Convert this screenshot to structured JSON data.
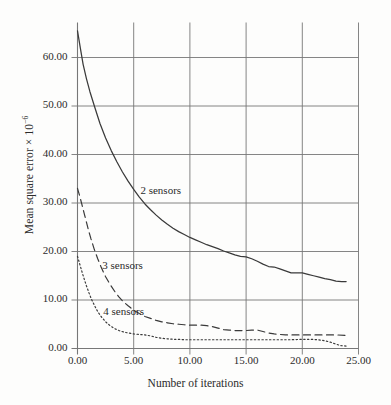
{
  "chart_data": {
    "type": "line",
    "title": "",
    "xlabel": "Number of iterations",
    "ylabel": "Mean square error × 10",
    "ylabel_exponent": "−6",
    "xlim": [
      0,
      25
    ],
    "ylim": [
      0,
      60
    ],
    "xticks": [
      "0.00",
      "5.00",
      "10.00",
      "15.00",
      "20.00",
      "25.00"
    ],
    "yticks": [
      "0.00",
      "10.00",
      "20.00",
      "30.00",
      "40.00",
      "50.00",
      "60.00"
    ],
    "xtick_values": [
      0,
      5,
      10,
      15,
      20,
      25
    ],
    "ytick_values": [
      0,
      10,
      20,
      30,
      40,
      50,
      60
    ],
    "grid": true,
    "legend_position": "inline-annotations",
    "series": [
      {
        "name": "2 sensors",
        "style": "solid",
        "color": "#3a3a3a",
        "annotation": "2 sensors",
        "annotation_xy": [
          5.6,
          31.8
        ],
        "x": [
          0.0,
          0.25,
          0.5,
          0.8,
          1.1,
          1.5,
          2.0,
          2.5,
          3.0,
          3.5,
          4.0,
          4.5,
          5.0,
          5.5,
          6.0,
          6.5,
          7.0,
          7.5,
          8.0,
          8.5,
          9.0,
          9.5,
          10.0,
          10.5,
          11.0,
          11.5,
          12.0,
          12.5,
          13.0,
          13.5,
          14.0,
          14.5,
          15.0,
          15.5,
          16.0,
          16.5,
          17.0,
          17.5,
          18.0,
          18.5,
          19.0,
          19.5,
          20.0,
          20.5,
          21.0,
          21.5,
          22.0,
          22.5,
          23.0,
          23.5,
          23.9
        ],
        "y": [
          65.5,
          62.0,
          58.6,
          55.6,
          53.0,
          50.0,
          46.4,
          43.4,
          40.8,
          38.5,
          36.4,
          34.5,
          32.8,
          31.2,
          29.8,
          28.6,
          27.5,
          26.5,
          25.6,
          24.8,
          24.1,
          23.5,
          22.9,
          22.4,
          21.9,
          21.4,
          21.0,
          20.6,
          20.1,
          19.7,
          19.3,
          19.0,
          18.9,
          18.5,
          18.0,
          17.4,
          16.9,
          16.8,
          16.4,
          16.0,
          15.6,
          15.6,
          15.6,
          15.3,
          15.0,
          14.7,
          14.4,
          14.2,
          13.9,
          13.8,
          13.8
        ]
      },
      {
        "name": "3 sensors",
        "style": "dashed",
        "color": "#3a3a3a",
        "annotation": "3 sensors",
        "annotation_xy": [
          2.2,
          16.3
        ],
        "x": [
          0.0,
          0.2,
          0.4,
          0.6,
          0.8,
          1.0,
          1.2,
          1.5,
          1.8,
          2.1,
          2.5,
          2.9,
          3.3,
          3.7,
          4.1,
          4.5,
          5.0,
          5.5,
          6.0,
          6.5,
          7.0,
          7.5,
          8.0,
          8.5,
          9.0,
          9.5,
          10.0,
          10.5,
          11.0,
          11.5,
          12.0,
          12.5,
          13.0,
          13.5,
          14.0,
          14.5,
          15.0,
          15.5,
          16.0,
          16.5,
          17.0,
          17.5,
          18.0,
          18.5,
          19.0,
          20.0,
          21.0,
          22.0,
          23.0,
          23.9
        ],
        "y": [
          33.0,
          31.4,
          29.6,
          27.8,
          26.0,
          24.2,
          22.6,
          20.4,
          18.5,
          16.8,
          14.8,
          13.2,
          11.8,
          10.6,
          9.6,
          8.8,
          7.9,
          7.2,
          6.6,
          6.2,
          5.8,
          5.5,
          5.3,
          5.1,
          5.0,
          4.9,
          4.8,
          4.8,
          4.8,
          4.7,
          4.5,
          4.2,
          3.9,
          3.8,
          3.7,
          3.7,
          3.7,
          3.8,
          3.8,
          3.5,
          3.2,
          3.0,
          2.9,
          2.8,
          2.8,
          2.8,
          2.8,
          2.8,
          2.8,
          2.7
        ]
      },
      {
        "name": "4 sensors",
        "style": "dotted",
        "color": "#3a3a3a",
        "annotation": "4 sensors",
        "annotation_xy": [
          2.3,
          7.0
        ],
        "x": [
          0.0,
          0.2,
          0.4,
          0.6,
          0.8,
          1.0,
          1.2,
          1.5,
          1.8,
          2.1,
          2.5,
          2.9,
          3.3,
          3.7,
          4.1,
          4.5,
          5.0,
          5.5,
          6.0,
          6.5,
          7.0,
          7.5,
          8.0,
          8.5,
          9.0,
          9.5,
          10.0,
          11.0,
          12.0,
          13.0,
          14.0,
          15.0,
          16.0,
          17.0,
          18.0,
          19.0,
          20.0,
          20.8,
          21.4,
          22.0,
          22.5,
          23.0,
          23.4,
          23.9
        ],
        "y": [
          19.0,
          17.4,
          15.8,
          14.3,
          12.9,
          11.6,
          10.4,
          8.9,
          7.6,
          6.6,
          5.5,
          4.7,
          4.1,
          3.7,
          3.4,
          3.2,
          3.0,
          2.9,
          2.8,
          2.6,
          2.3,
          2.1,
          2.0,
          1.9,
          1.9,
          1.8,
          1.8,
          1.8,
          1.8,
          1.8,
          1.8,
          1.8,
          1.8,
          1.8,
          1.8,
          1.8,
          1.9,
          1.9,
          1.8,
          1.6,
          1.3,
          0.9,
          0.6,
          0.5
        ]
      }
    ]
  }
}
